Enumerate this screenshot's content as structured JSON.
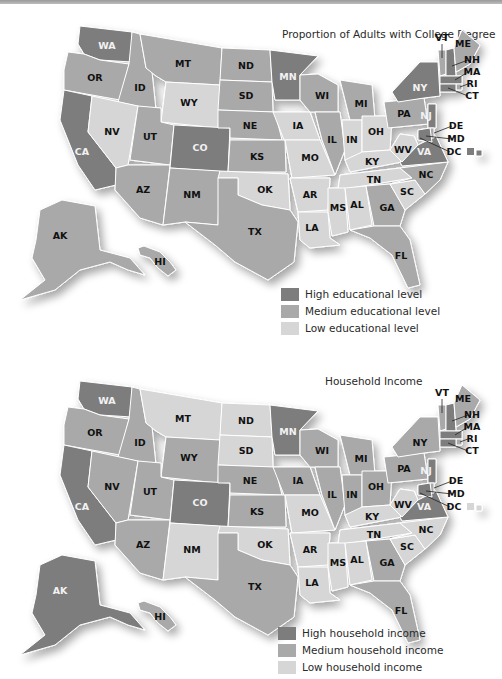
{
  "colors": {
    "high": "#7d7d7d",
    "medium": "#a9a9a9",
    "low": "#d6d6d6",
    "label_dark": "#111111",
    "label_light": "#f2f2f2"
  },
  "maps": [
    {
      "title": "Proportion of Adults with College Degree",
      "legend": [
        {
          "level": "high",
          "label": "High educational level"
        },
        {
          "level": "medium",
          "label": "Medium educational level"
        },
        {
          "level": "low",
          "label": "Low educational level"
        }
      ],
      "states": {
        "WA": "high",
        "OR": "medium",
        "CA": "high",
        "ID": "medium",
        "NV": "low",
        "MT": "medium",
        "WY": "low",
        "UT": "medium",
        "AZ": "medium",
        "CO": "high",
        "NM": "medium",
        "ND": "medium",
        "SD": "medium",
        "NE": "medium",
        "KS": "medium",
        "OK": "low",
        "TX": "medium",
        "MN": "high",
        "IA": "low",
        "MO": "low",
        "AR": "low",
        "LA": "low",
        "WI": "medium",
        "IL": "medium",
        "MI": "medium",
        "IN": "low",
        "OH": "low",
        "KY": "low",
        "TN": "low",
        "MS": "low",
        "AL": "low",
        "GA": "medium",
        "FL": "medium",
        "SC": "low",
        "NC": "medium",
        "VA": "high",
        "WV": "low",
        "PA": "medium",
        "NY": "high",
        "VT": "medium",
        "NH": "high",
        "ME": "medium",
        "MA": "high",
        "RI": "medium",
        "CT": "high",
        "NJ": "high",
        "DE": "medium",
        "MD": "high",
        "DC": "high",
        "AK": "medium",
        "HI": "medium"
      }
    },
    {
      "title": "Household Income",
      "legend": [
        {
          "level": "high",
          "label": "High household income"
        },
        {
          "level": "medium",
          "label": "Medium household income"
        },
        {
          "level": "low",
          "label": "Low household income"
        }
      ],
      "states": {
        "WA": "high",
        "OR": "medium",
        "CA": "high",
        "ID": "medium",
        "NV": "medium",
        "MT": "low",
        "WY": "medium",
        "UT": "medium",
        "AZ": "medium",
        "CO": "high",
        "NM": "low",
        "ND": "low",
        "SD": "low",
        "NE": "medium",
        "KS": "medium",
        "OK": "low",
        "TX": "medium",
        "MN": "high",
        "IA": "medium",
        "MO": "low",
        "AR": "low",
        "LA": "low",
        "WI": "medium",
        "IL": "medium",
        "MI": "medium",
        "IN": "medium",
        "OH": "medium",
        "KY": "low",
        "TN": "low",
        "MS": "low",
        "AL": "low",
        "GA": "medium",
        "FL": "medium",
        "SC": "low",
        "NC": "low",
        "VA": "high",
        "WV": "low",
        "PA": "medium",
        "NY": "medium",
        "VT": "medium",
        "NH": "high",
        "ME": "medium",
        "MA": "high",
        "RI": "medium",
        "CT": "high",
        "NJ": "high",
        "DE": "medium",
        "MD": "high",
        "DC": "low",
        "AK": "high",
        "HI": "medium"
      }
    }
  ],
  "state_labels": [
    "WA",
    "OR",
    "CA",
    "ID",
    "NV",
    "MT",
    "WY",
    "UT",
    "AZ",
    "CO",
    "NM",
    "ND",
    "SD",
    "NE",
    "KS",
    "OK",
    "TX",
    "MN",
    "IA",
    "MO",
    "AR",
    "LA",
    "WI",
    "IL",
    "MI",
    "IN",
    "OH",
    "KY",
    "TN",
    "MS",
    "AL",
    "GA",
    "FL",
    "SC",
    "NC",
    "VA",
    "WV",
    "PA",
    "NY",
    "VT",
    "NH",
    "ME",
    "MA",
    "RI",
    "CT",
    "NJ",
    "DE",
    "MD",
    "DC",
    "AK",
    "HI"
  ]
}
